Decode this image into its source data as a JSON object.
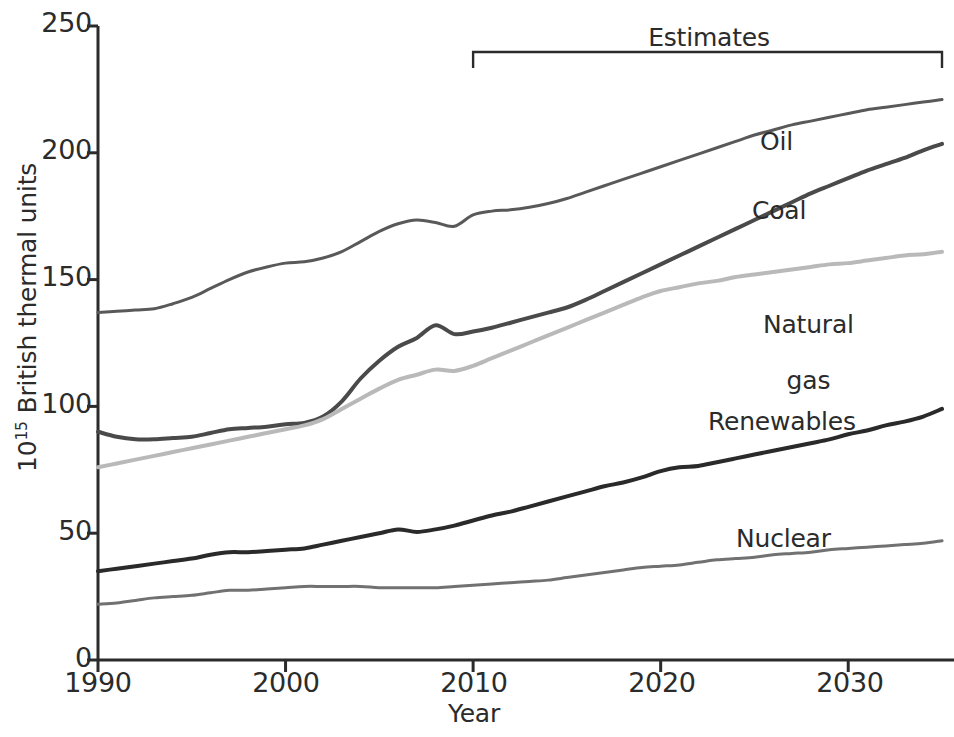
{
  "figure": {
    "background_color": "#ffffff",
    "axis_color": "#2b2b2b"
  },
  "axes": {
    "y_axis_title_prefix": "10",
    "y_axis_title_exponent": "15",
    "y_axis_title_suffix": " British thermal units",
    "x_axis_title": "Year",
    "y_ticks": [
      "0",
      "50",
      "100",
      "150",
      "200",
      "250"
    ],
    "x_ticks": [
      "1990",
      "2000",
      "2010",
      "2020",
      "2030"
    ],
    "ylim": [
      0,
      250
    ],
    "xlim": [
      1990,
      2035
    ],
    "grid": false
  },
  "annotations": {
    "estimates_label": "Estimates",
    "estimates_start_year": 2010,
    "estimates_end_year": 2035
  },
  "series_labels": {
    "oil": "Oil",
    "coal": "Coal",
    "natural_gas_line1": "Natural",
    "natural_gas_line2": "gas",
    "renewables": "Renewables",
    "nuclear": "Nuclear"
  },
  "chart_data": {
    "type": "line",
    "title": "",
    "xlabel": "Year",
    "ylabel": "10^15 British thermal units",
    "xlim": [
      1990,
      2035
    ],
    "ylim": [
      0,
      250
    ],
    "grid": false,
    "legend_position": "inline-labels",
    "annotations": [
      {
        "text": "Estimates",
        "x_start": 2010,
        "x_end": 2035,
        "type": "bracket"
      }
    ],
    "x": [
      1990,
      1991,
      1992,
      1993,
      1994,
      1995,
      1996,
      1997,
      1998,
      1999,
      2000,
      2001,
      2002,
      2003,
      2004,
      2005,
      2006,
      2007,
      2008,
      2009,
      2010,
      2011,
      2012,
      2013,
      2014,
      2015,
      2016,
      2017,
      2018,
      2019,
      2020,
      2021,
      2022,
      2023,
      2024,
      2025,
      2026,
      2027,
      2028,
      2029,
      2030,
      2031,
      2032,
      2033,
      2034,
      2035
    ],
    "series": [
      {
        "name": "Oil",
        "color": "#595959",
        "width": 3,
        "values": [
          137,
          137.5,
          138,
          138.5,
          140.5,
          143,
          146.5,
          150,
          153,
          155,
          156.5,
          157,
          158.5,
          161,
          165,
          169,
          172,
          173.5,
          172.5,
          171,
          175.5,
          177,
          177.5,
          178.5,
          180,
          182,
          184.5,
          187,
          189.5,
          192,
          194.5,
          197,
          199.5,
          202,
          204.5,
          207,
          209,
          211,
          212.5,
          214,
          215.5,
          217,
          218,
          219,
          220,
          221
        ]
      },
      {
        "name": "Coal",
        "color": "#4a4a4a",
        "width": 4,
        "values": [
          90,
          88,
          87,
          87,
          87.5,
          88,
          89.5,
          91,
          91.5,
          92,
          93,
          93.5,
          96,
          102,
          111,
          118,
          123.5,
          127,
          132,
          128.5,
          129.5,
          131,
          133,
          135,
          137,
          139,
          142,
          145.5,
          149,
          152.5,
          156,
          159.5,
          163,
          166.5,
          170,
          173.5,
          177,
          180.5,
          184,
          187,
          190,
          193,
          195.5,
          198,
          201,
          203.5
        ]
      },
      {
        "name": "Natural gas",
        "color": "#b9b9b9",
        "width": 4,
        "values": [
          76,
          77.5,
          79,
          80.5,
          82,
          83.5,
          85,
          86.5,
          88,
          89.5,
          91,
          92.5,
          95,
          99,
          103,
          107,
          110.5,
          112.5,
          114.5,
          114,
          116,
          119,
          122,
          125,
          128,
          131,
          134,
          137,
          140,
          143,
          145.5,
          147,
          148.5,
          149.5,
          151,
          152,
          153,
          154,
          155,
          156,
          156.5,
          157.5,
          158.5,
          159.5,
          160,
          161
        ]
      },
      {
        "name": "Renewables",
        "color": "#2a2a2a",
        "width": 4,
        "values": [
          35,
          36,
          37,
          38,
          39,
          40,
          41.5,
          42.5,
          42.5,
          43,
          43.5,
          44,
          45.5,
          47,
          48.5,
          50,
          51.5,
          50.5,
          51.5,
          53,
          55,
          57,
          58.5,
          60.5,
          62.5,
          64.5,
          66.5,
          68.5,
          70,
          72,
          74.5,
          76,
          76.5,
          78,
          79.5,
          81,
          82.5,
          84,
          85.5,
          87,
          89,
          90.5,
          92.5,
          94,
          96,
          99
        ]
      },
      {
        "name": "Nuclear",
        "color": "#717171",
        "width": 3,
        "values": [
          22,
          22.5,
          23.5,
          24.5,
          25,
          25.5,
          26.5,
          27.5,
          27.5,
          28,
          28.5,
          29,
          29,
          29,
          29,
          28.5,
          28.5,
          28.5,
          28.5,
          29,
          29.5,
          30,
          30.5,
          31,
          31.5,
          32.5,
          33.5,
          34.5,
          35.5,
          36.5,
          37,
          37.5,
          38.5,
          39.5,
          40,
          40.5,
          41.5,
          42,
          42.5,
          43.5,
          44,
          44.5,
          45,
          45.5,
          46,
          47
        ]
      }
    ]
  },
  "label_positions": {
    "oil": {
      "x": 760,
      "y": 128
    },
    "coal": {
      "x": 752,
      "y": 197
    },
    "natural_gas": {
      "x": 732,
      "y": 283
    },
    "renewables": {
      "x": 708,
      "y": 408
    },
    "nuclear": {
      "x": 736,
      "y": 525
    }
  }
}
